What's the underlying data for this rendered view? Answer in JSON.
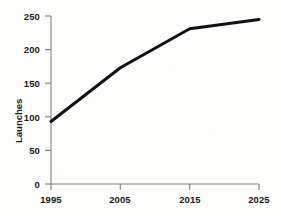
{
  "chart_data": {
    "type": "line",
    "title": "",
    "xlabel": "",
    "ylabel": "Launches",
    "x": [
      1995,
      2005,
      2015,
      2025
    ],
    "values": [
      93,
      173,
      231,
      245
    ],
    "series": [
      {
        "name": "Launches",
        "values": [
          93,
          173,
          231,
          245
        ]
      }
    ],
    "xlim": [
      1995,
      2025
    ],
    "ylim": [
      0,
      250
    ],
    "xticks": [
      "1995",
      "2005",
      "2015",
      "2025"
    ],
    "yticks": [
      "0",
      "50",
      "100",
      "150",
      "200",
      "250"
    ],
    "grid": false,
    "legend": false,
    "legend_position": "none",
    "line_color": "#111111",
    "axis_color": "#808080",
    "background_color": "#fdfdfb",
    "markers": false,
    "line_width": 3
  }
}
